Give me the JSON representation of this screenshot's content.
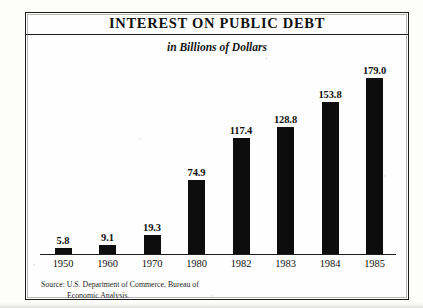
{
  "page": {
    "clipped_caption": "CHART 11"
  },
  "chart": {
    "title": "INTEREST ON PUBLIC DEBT",
    "subtitle": "in Billions of Dollars",
    "source_line_1": "Source: U.S. Department of Commerce, Bureau of",
    "source_line_2": "Economic Analysis.",
    "bar_color": "#0d0d0d",
    "frame_color": "#1b1b1b",
    "paper_color": "#fdfdfc"
  },
  "chart_data": {
    "type": "bar",
    "title": "INTEREST ON PUBLIC DEBT",
    "subtitle": "in Billions of Dollars",
    "xlabel": "",
    "ylabel": "Billions of Dollars",
    "categories": [
      "1950",
      "1960",
      "1970",
      "1980",
      "1982",
      "1983",
      "1984",
      "1985"
    ],
    "values": [
      5.8,
      9.1,
      19.3,
      74.9,
      117.4,
      128.8,
      153.8,
      179.0
    ],
    "value_labels": [
      "5.8",
      "9.1",
      "19.3",
      "74.9",
      "117.4",
      "128.8",
      "153.8",
      "179.0"
    ],
    "ylim": [
      0,
      179.0
    ],
    "grid": false,
    "legend": null,
    "annotations": [
      "Source: U.S. Department of Commerce, Bureau of Economic Analysis."
    ]
  }
}
